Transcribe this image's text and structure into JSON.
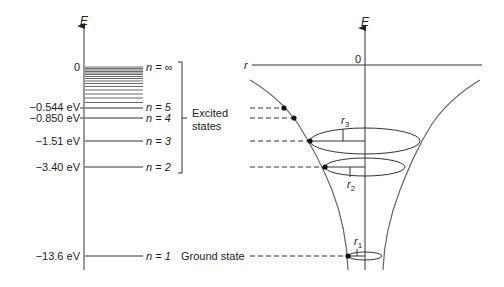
{
  "diagram": {
    "type": "hydrogen-energy-levels",
    "left_panel": {
      "axis_label": "E",
      "levels": [
        {
          "n": "∞",
          "energy_label": "0",
          "n_label": "n = ∞",
          "y": 67
        },
        {
          "n": "5",
          "energy_label": "−0.544 eV",
          "n_label": "n = 5",
          "y": 108
        },
        {
          "n": "4",
          "energy_label": "−0.850 eV",
          "n_label": "n = 4",
          "y": 118
        },
        {
          "n": "3",
          "energy_label": "−1.51 eV",
          "n_label": "n = 3",
          "y": 141
        },
        {
          "n": "2",
          "energy_label": "−3.40 eV",
          "n_label": "n = 2",
          "y": 167
        },
        {
          "n": "1",
          "energy_label": "−13.6 eV",
          "n_label": "n = 1",
          "y": 256
        }
      ],
      "bracket_label_line1": "Excited",
      "bracket_label_line2": "states",
      "ground_label": "Ground state"
    },
    "right_panel": {
      "axis_label": "E",
      "r_axis_label": "r",
      "origin_label": "0",
      "radius_labels": {
        "r1": "r",
        "r1_sub": "1",
        "r2": "r",
        "r2_sub": "2",
        "r3": "r",
        "r3_sub": "3"
      }
    },
    "colors": {
      "line": "#333333",
      "curve": "#555555",
      "text": "#222222"
    }
  }
}
